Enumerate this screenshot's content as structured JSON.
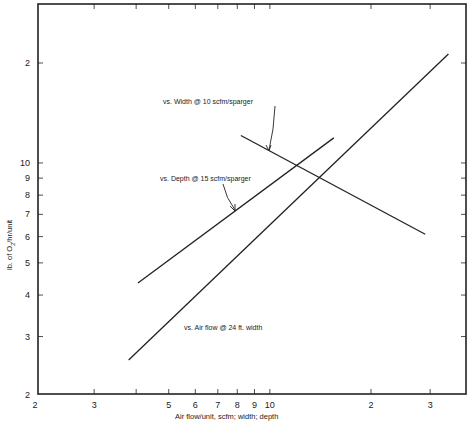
{
  "chart_data": {
    "type": "line",
    "title": "",
    "xlabel": "Air flow/unit, scfm; width; depth",
    "ylabel": "lb. of O2/hr/unit",
    "xscale": "log",
    "yscale": "log",
    "xlim": [
      2,
      40
    ],
    "ylim": [
      2,
      30
    ],
    "grid": false,
    "x_ticks": [
      2,
      3,
      4,
      5,
      6,
      7,
      8,
      9,
      10,
      20,
      30
    ],
    "x_tick_labels": [
      "2",
      "3",
      "",
      "5",
      "6",
      "7",
      "8",
      "9",
      "10",
      "2",
      "3"
    ],
    "y_ticks": [
      2,
      3,
      4,
      5,
      6,
      7,
      8,
      9,
      10,
      20
    ],
    "y_tick_labels": [
      "2",
      "3",
      "4",
      "5",
      "6",
      "7",
      "8",
      "9",
      "10",
      "2"
    ],
    "series": [
      {
        "name": "vs. Air flow @ 24 ft. width",
        "x": [
          3.8,
          34
        ],
        "y": [
          2.55,
          21.3
        ]
      },
      {
        "name": "vs. Depth @ 15 scfm/sparger",
        "x": [
          4.05,
          15.5
        ],
        "y": [
          4.35,
          11.9
        ]
      },
      {
        "name": "vs. Width @ 10 scfm/sparger",
        "x": [
          8.2,
          29
        ],
        "y": [
          12.1,
          6.1
        ]
      }
    ],
    "annotations": [
      {
        "text": "vs. Width @ 10 scfm/sparger",
        "points_to": "series 3"
      },
      {
        "text": "vs. Depth @ 15 scfm/sparger",
        "points_to": "series 2"
      },
      {
        "text": "vs. Air flow @ 24 ft. width",
        "points_to": "series 1"
      }
    ],
    "legend": "none (inline annotations)"
  },
  "labels": {
    "xlabel": "Air flow/unit, scfm; width; depth",
    "ylabel_pre": "lb. of O",
    "ylabel_sub": "2",
    "ylabel_post": "/hr/unit",
    "annot_width": "vs. Width @ 10 scfm/sparger",
    "annot_depth": "vs. Depth @ 15 scfm/sparger",
    "annot_airflow": "vs. Air flow @ 24 ft. width"
  }
}
